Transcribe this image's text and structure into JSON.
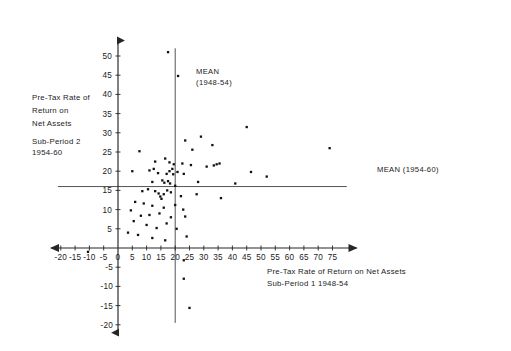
{
  "chart_data": {
    "type": "scatter",
    "title": "",
    "xlabel": "Pre-Tax Rate of Return on Net Assets  Sub-Period 1  1948-54",
    "ylabel": "Pre-Tax Rate of Return on Net Assets  Sub-Period 2  1954-60",
    "xlim": [
      -22,
      82
    ],
    "ylim": [
      -21,
      53
    ],
    "grid": false,
    "legend": null,
    "x_ticks": [
      -20,
      -15,
      -10,
      -5,
      0,
      5,
      10,
      15,
      20,
      25,
      30,
      35,
      40,
      45,
      50,
      55,
      60,
      65,
      70,
      75
    ],
    "y_ticks": [
      -20,
      -15,
      -10,
      -5,
      5,
      10,
      15,
      20,
      25,
      30,
      35,
      40,
      45,
      50
    ],
    "x_tick_labels": [
      "-20",
      "-15",
      "-10",
      "-5",
      "0",
      "5",
      "10",
      "15",
      "20",
      "25",
      "30",
      "35",
      "40",
      "45",
      "50",
      "55",
      "60",
      "65",
      "70",
      "75"
    ],
    "y_tick_labels": [
      "-20",
      "-15",
      "-10",
      "-5",
      "5",
      "10",
      "15",
      "20",
      "25",
      "30",
      "35",
      "40",
      "45",
      "50"
    ],
    "annotations": [
      {
        "name": "mean-vertical",
        "text": "MEAN\n(1948-54)",
        "line": "vertical",
        "value": 20.0
      },
      {
        "name": "mean-horizontal",
        "text": "MEAN (1954-60)",
        "line": "horizontal",
        "value": 16.0
      }
    ],
    "points": [
      [
        17.5,
        51.0
      ],
      [
        21.0,
        44.8
      ],
      [
        7.5,
        25.2
      ],
      [
        23.5,
        28.0
      ],
      [
        29.0,
        29.0
      ],
      [
        26.0,
        25.6
      ],
      [
        33.0,
        26.8
      ],
      [
        45.0,
        31.5
      ],
      [
        74.0,
        26.0
      ],
      [
        13.0,
        22.5
      ],
      [
        16.5,
        23.3
      ],
      [
        18.0,
        22.3
      ],
      [
        19.5,
        21.8
      ],
      [
        22.5,
        22.0
      ],
      [
        25.5,
        21.6
      ],
      [
        5.0,
        20.0
      ],
      [
        11.0,
        20.2
      ],
      [
        12.5,
        20.6
      ],
      [
        14.0,
        19.5
      ],
      [
        17.0,
        19.3
      ],
      [
        18.0,
        20.0
      ],
      [
        19.0,
        20.6
      ],
      [
        19.3,
        19.2
      ],
      [
        20.8,
        19.8
      ],
      [
        23.0,
        19.3
      ],
      [
        31.0,
        21.2
      ],
      [
        33.5,
        21.5
      ],
      [
        34.5,
        21.8
      ],
      [
        35.5,
        22.0
      ],
      [
        46.5,
        19.8
      ],
      [
        52.0,
        18.6
      ],
      [
        12.0,
        17.2
      ],
      [
        15.5,
        17.6
      ],
      [
        16.2,
        17.0
      ],
      [
        17.5,
        17.4
      ],
      [
        18.2,
        16.8
      ],
      [
        20.0,
        16.2
      ],
      [
        28.0,
        17.2
      ],
      [
        41.0,
        16.8
      ],
      [
        8.5,
        14.8
      ],
      [
        10.5,
        15.3
      ],
      [
        13.0,
        14.8
      ],
      [
        14.2,
        14.2
      ],
      [
        14.8,
        13.4
      ],
      [
        15.2,
        12.8
      ],
      [
        16.0,
        14.0
      ],
      [
        17.2,
        15.0
      ],
      [
        18.5,
        14.5
      ],
      [
        22.0,
        13.5
      ],
      [
        27.5,
        14.0
      ],
      [
        36.0,
        13.0
      ],
      [
        6.0,
        12.0
      ],
      [
        9.0,
        11.6
      ],
      [
        12.0,
        11.0
      ],
      [
        16.0,
        10.5
      ],
      [
        20.0,
        11.2
      ],
      [
        22.8,
        10.0
      ],
      [
        4.5,
        9.8
      ],
      [
        8.0,
        8.4
      ],
      [
        11.0,
        8.6
      ],
      [
        14.5,
        9.0
      ],
      [
        18.5,
        8.0
      ],
      [
        23.5,
        8.2
      ],
      [
        5.5,
        7.0
      ],
      [
        10.0,
        6.0
      ],
      [
        13.5,
        5.2
      ],
      [
        17.0,
        6.4
      ],
      [
        20.5,
        5.0
      ],
      [
        3.5,
        4.0
      ],
      [
        7.0,
        3.4
      ],
      [
        12.0,
        2.6
      ],
      [
        16.5,
        2.0
      ],
      [
        24.0,
        3.0
      ],
      [
        -10.5,
        -1.0
      ],
      [
        23.0,
        -3.2
      ],
      [
        23.0,
        -8.0
      ],
      [
        25.0,
        -15.6
      ]
    ]
  },
  "labels": {
    "y_axis_title_lines": [
      "Pre-Tax Rate of",
      "Return on",
      "Net Assets",
      "Sub-Period 2",
      "1954-60"
    ],
    "x_axis_title_lines": [
      "Pre-Tax Rate of Return on Net Assets",
      "Sub-Period 1  1948-54"
    ],
    "mean_vertical_lines": [
      "MEAN",
      "(1948-54)"
    ],
    "mean_horizontal": "MEAN (1954-60)"
  },
  "colors": {
    "background": "#ffffff",
    "axis": "#262626",
    "point": "#111111",
    "mean_line": "#343434",
    "text": "#1b1b1b"
  }
}
